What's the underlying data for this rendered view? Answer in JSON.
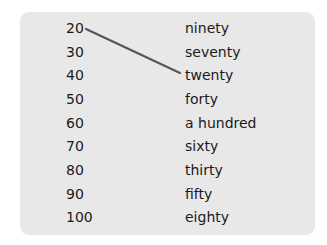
{
  "exercise": {
    "numbers": [
      "20",
      "30",
      "40",
      "50",
      "60",
      "70",
      "80",
      "90",
      "100"
    ],
    "words": [
      "ninety",
      "seventy",
      "twenty",
      "forty",
      "a hundred",
      "sixty",
      "thirty",
      "fifty",
      "eighty"
    ],
    "matched_line": {
      "from_number": "20",
      "to_word": "twenty",
      "color": "#555555"
    }
  }
}
